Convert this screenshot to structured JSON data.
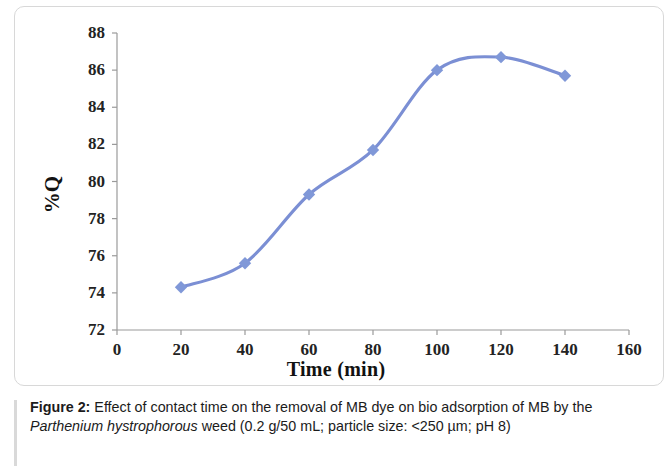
{
  "figure": {
    "caption_label": "Figure 2:",
    "caption_part1": " Effect of contact time on the removal of MB dye on bio adsorption of MB by the ",
    "caption_species": "Parthenium hystrophorous",
    "caption_part2": " weed (0.2 g/50 mL; particle size: <250 µm; pH 8)"
  },
  "chart_data": {
    "type": "line",
    "title": "",
    "xlabel": "Time (min)",
    "ylabel": "%Q",
    "x": [
      20,
      40,
      60,
      80,
      100,
      120,
      140
    ],
    "values": [
      74.3,
      75.6,
      79.3,
      81.7,
      86.0,
      86.7,
      85.7
    ],
    "series": [
      {
        "name": "%Q",
        "values": [
          74.3,
          75.6,
          79.3,
          81.7,
          86.0,
          86.7,
          85.7
        ]
      }
    ],
    "xlim": [
      0,
      160
    ],
    "ylim": [
      72,
      88
    ],
    "xticks": [
      0,
      20,
      40,
      60,
      80,
      100,
      120,
      140,
      160
    ],
    "yticks": [
      72,
      74,
      76,
      78,
      80,
      82,
      84,
      86,
      88
    ],
    "xtick_labels": [
      "0",
      "20",
      "40",
      "60",
      "80",
      "100",
      "120",
      "140",
      "160"
    ],
    "ytick_labels": [
      "72",
      "74",
      "76",
      "78",
      "80",
      "82",
      "84",
      "86",
      "88"
    ],
    "grid": false,
    "legend": false,
    "marker": "diamond",
    "line_color": "#7b8fd4",
    "marker_color": "#8098d8",
    "axis_color": "#9a9a9a"
  }
}
